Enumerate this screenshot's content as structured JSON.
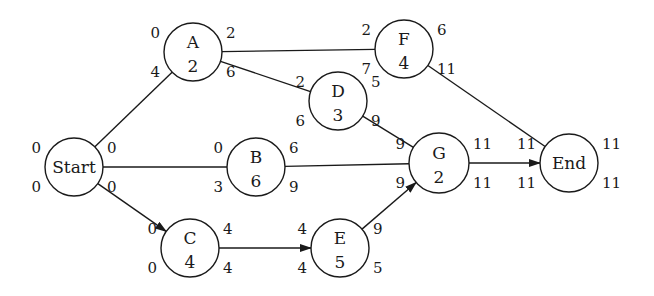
{
  "diagram": {
    "type": "project-network-activity-on-node",
    "colors": {
      "stroke": "#1a1a1a",
      "background": "#ffffff"
    },
    "nodes": [
      {
        "id": "Start",
        "label": "Start",
        "duration": "",
        "cx": 74,
        "cy": 167,
        "r": 29,
        "tl": "0",
        "tr": "0",
        "bl": "0",
        "br": "0"
      },
      {
        "id": "A",
        "label": "A",
        "duration": "2",
        "cx": 193,
        "cy": 52,
        "r": 29,
        "tl": "0",
        "tr": "2",
        "bl": "4",
        "br": "6"
      },
      {
        "id": "B",
        "label": "B",
        "duration": "6",
        "cx": 256,
        "cy": 167,
        "r": 29,
        "tl": "0",
        "tr": "6",
        "bl": "3",
        "br": "9"
      },
      {
        "id": "C",
        "label": "C",
        "duration": "4",
        "cx": 190,
        "cy": 248,
        "r": 29,
        "tl": "0",
        "tr": "4",
        "bl": "0",
        "br": "4"
      },
      {
        "id": "D",
        "label": "D",
        "duration": "3",
        "cx": 338,
        "cy": 101,
        "r": 29,
        "tl": "2",
        "tr": "5",
        "bl": "6",
        "br": "9"
      },
      {
        "id": "E",
        "label": "E",
        "duration": "5",
        "cx": 340,
        "cy": 248,
        "r": 29,
        "tl": "4",
        "tr": "9",
        "bl": "4",
        "br": "5"
      },
      {
        "id": "F",
        "label": "F",
        "duration": "4",
        "cx": 404,
        "cy": 49,
        "r": 29,
        "tl": "2",
        "tr": "6",
        "bl": "7",
        "br": "11"
      },
      {
        "id": "G",
        "label": "G",
        "duration": "2",
        "cx": 439,
        "cy": 163,
        "r": 30,
        "tl": "9",
        "tr": "11",
        "bl": "9",
        "br": "11"
      },
      {
        "id": "End",
        "label": "End",
        "duration": "",
        "cx": 569,
        "cy": 163,
        "r": 29,
        "tl": "11",
        "tr": "11",
        "bl": "11",
        "br": "11"
      }
    ],
    "edges": [
      {
        "from": "Start",
        "to": "A",
        "arrow": false
      },
      {
        "from": "Start",
        "to": "B",
        "arrow": false
      },
      {
        "from": "Start",
        "to": "C",
        "arrow": true
      },
      {
        "from": "A",
        "to": "F",
        "arrow": false
      },
      {
        "from": "A",
        "to": "D",
        "arrow": false
      },
      {
        "from": "B",
        "to": "G",
        "arrow": false
      },
      {
        "from": "C",
        "to": "E",
        "arrow": true
      },
      {
        "from": "D",
        "to": "G",
        "arrow": false
      },
      {
        "from": "E",
        "to": "G",
        "arrow": true
      },
      {
        "from": "F",
        "to": "End",
        "arrow": false
      },
      {
        "from": "G",
        "to": "End",
        "arrow": true
      }
    ]
  }
}
